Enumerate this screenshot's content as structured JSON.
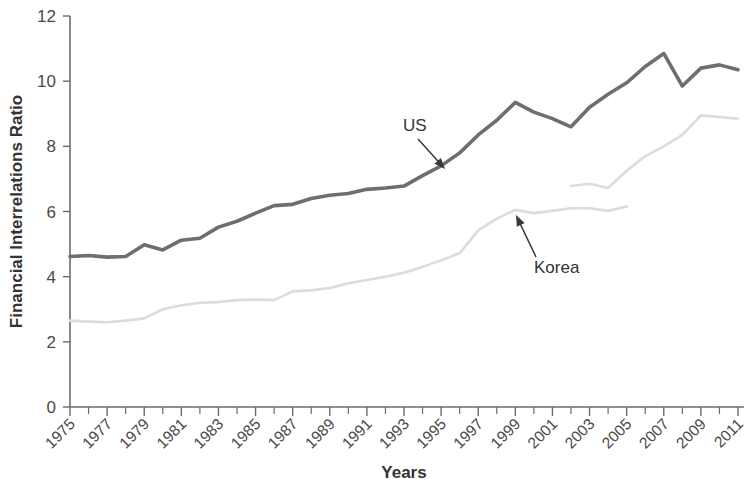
{
  "chart_data": {
    "type": "line",
    "title": "",
    "xlabel": "Years",
    "ylabel": "Financial Interrelations Ratio",
    "xlim": [
      1975,
      2011
    ],
    "ylim": [
      0,
      12
    ],
    "ytick_labels": [
      "0",
      "2",
      "4",
      "6",
      "8",
      "10",
      "12"
    ],
    "ytick_values": [
      0,
      2,
      4,
      6,
      8,
      10,
      12
    ],
    "xtick_labels": [
      "1975",
      "1977",
      "1979",
      "1981",
      "1983",
      "1985",
      "1987",
      "1989",
      "1991",
      "1993",
      "1995",
      "1997",
      "1999",
      "2001",
      "2003",
      "2005",
      "2007",
      "2009",
      "2011"
    ],
    "xtick_values": [
      1975,
      1977,
      1979,
      1981,
      1983,
      1985,
      1987,
      1989,
      1991,
      1993,
      1995,
      1997,
      1999,
      2001,
      2003,
      2005,
      2007,
      2009,
      2011
    ],
    "grid": false,
    "legend": "annotations",
    "series": [
      {
        "name": "US",
        "color": "#6e6e6e",
        "x": [
          1975,
          1976,
          1977,
          1978,
          1979,
          1980,
          1981,
          1982,
          1983,
          1984,
          1985,
          1986,
          1987,
          1988,
          1989,
          1990,
          1991,
          1992,
          1993,
          1994,
          1995,
          1996,
          1997,
          1998,
          1999,
          2000,
          2001,
          2002,
          2003,
          2004,
          2005,
          2006,
          2007,
          2008,
          2009,
          2010,
          2011
        ],
        "values": [
          4.62,
          4.65,
          4.6,
          4.62,
          4.98,
          4.82,
          5.12,
          5.18,
          5.52,
          5.7,
          5.95,
          6.18,
          6.22,
          6.4,
          6.5,
          6.55,
          6.68,
          6.72,
          6.78,
          7.1,
          7.4,
          7.8,
          8.35,
          8.8,
          9.35,
          9.05,
          8.85,
          8.6,
          9.2,
          9.6,
          9.95,
          10.45,
          10.85,
          9.85,
          10.4,
          10.5,
          10.35
        ]
      },
      {
        "name": "Korea",
        "color": "#dcdcdc",
        "x": [
          1975,
          1976,
          1977,
          1978,
          1979,
          1980,
          1981,
          1982,
          1983,
          1984,
          1985,
          1986,
          1987,
          1988,
          1989,
          1990,
          1991,
          1992,
          1993,
          1994,
          1995,
          1996,
          1997,
          1998,
          1999,
          2000,
          2001,
          2002,
          2003,
          2004,
          2005
        ],
        "values": [
          2.65,
          2.62,
          2.6,
          2.65,
          2.72,
          3.0,
          3.12,
          3.2,
          3.22,
          3.28,
          3.3,
          3.28,
          3.55,
          3.58,
          3.65,
          3.8,
          3.9,
          4.0,
          4.12,
          4.3,
          4.5,
          4.72,
          5.42,
          5.78,
          6.05,
          5.95,
          6.02,
          6.1,
          6.1,
          6.02,
          6.15
        ]
      },
      {
        "name": "Korea-revised",
        "color": "#dcdcdc",
        "x": [
          2002,
          2003,
          2004,
          2005,
          2006,
          2007,
          2008,
          2009,
          2010,
          2011
        ],
        "values": [
          6.78,
          6.85,
          6.72,
          7.25,
          7.7,
          8.0,
          8.35,
          8.95,
          8.9,
          8.85
        ]
      }
    ],
    "annotations": [
      {
        "name": "US",
        "label": "US",
        "label_x": 403,
        "label_y": 131,
        "arrow_from_x": 418,
        "arrow_from_y": 139,
        "arrow_to_x": 445,
        "arrow_to_y": 169
      },
      {
        "name": "Korea",
        "label": "Korea",
        "label_x": 534,
        "label_y": 273,
        "arrow_from_x": 536,
        "arrow_from_y": 257,
        "arrow_to_x": 516,
        "arrow_to_y": 215
      }
    ]
  }
}
